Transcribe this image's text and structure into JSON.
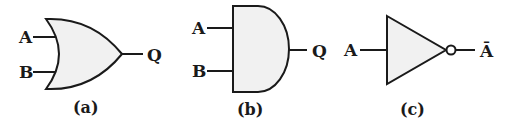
{
  "diagram": {
    "colors": {
      "stroke": "#1a1a1a",
      "fill": "#f1f1f1",
      "background": "#ffffff"
    },
    "gates": [
      {
        "id": "a",
        "type": "OR",
        "inputs": [
          "A",
          "B"
        ],
        "output": "Q",
        "caption": "(a)"
      },
      {
        "id": "b",
        "type": "AND",
        "inputs": [
          "A",
          "B"
        ],
        "output": "Q",
        "caption": "(b)"
      },
      {
        "id": "c",
        "type": "NOT",
        "inputs": [
          "A"
        ],
        "output": "Ā",
        "caption": "(c)"
      }
    ]
  }
}
